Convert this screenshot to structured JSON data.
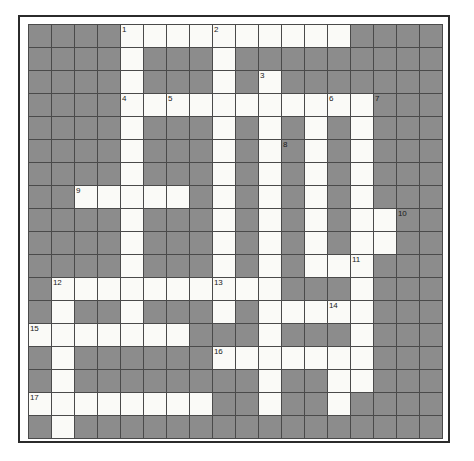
{
  "puzzle": {
    "title": "Crossword Grid",
    "type": "crossword",
    "columns": 18,
    "rows": 18,
    "cell_size_px": 23,
    "colors": {
      "block": "#8c8c8c",
      "open": "#fafaf7",
      "grid_line": "#4a4a4a",
      "frame": "#2b2b2b",
      "number_text": "#1a1a1a"
    },
    "clue_number_count": 17,
    "clue_numbers": [
      {
        "number": "1",
        "row": 0,
        "col": 4
      },
      {
        "number": "2",
        "row": 0,
        "col": 8
      },
      {
        "number": "3",
        "row": 2,
        "col": 10
      },
      {
        "number": "4",
        "row": 3,
        "col": 4
      },
      {
        "number": "5",
        "row": 3,
        "col": 6
      },
      {
        "number": "6",
        "row": 3,
        "col": 13
      },
      {
        "number": "7",
        "row": 3,
        "col": 15
      },
      {
        "number": "8",
        "row": 5,
        "col": 11
      },
      {
        "number": "9",
        "row": 7,
        "col": 2
      },
      {
        "number": "10",
        "row": 8,
        "col": 16
      },
      {
        "number": "11",
        "row": 10,
        "col": 14
      },
      {
        "number": "12",
        "row": 11,
        "col": 1
      },
      {
        "number": "13",
        "row": 11,
        "col": 8
      },
      {
        "number": "14",
        "row": 12,
        "col": 13
      },
      {
        "number": "15",
        "row": 13,
        "col": 0
      },
      {
        "number": "16",
        "row": 14,
        "col": 8
      },
      {
        "number": "17",
        "row": 16,
        "col": 0
      }
    ],
    "grid": [
      "0000111111111100",
      "0000100010000000",
      "0000100010100000",
      "0000111111111110",
      "0000100010101010",
      "0000100010101010",
      "0000100010101010",
      "0011111010101010",
      "0000100010101011",
      "0000100010101011",
      "0000100010101110",
      "0111111111100010",
      "0100100010111110",
      "1111111000100010",
      "0100000011111110",
      "0100000000100110",
      "1111111100100100",
      "0100000000000000"
    ]
  }
}
